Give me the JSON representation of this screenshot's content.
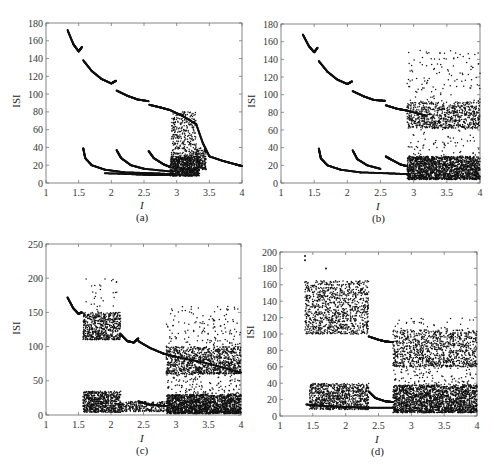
{
  "figure": {
    "panels": [
      {
        "id": "a",
        "caption": "(a)",
        "xlabel": "I",
        "ylabel": "ISI"
      },
      {
        "id": "b",
        "caption": "(b)",
        "xlabel": "I",
        "ylabel": "ISI"
      },
      {
        "id": "c",
        "caption": "(c)",
        "xlabel": "I",
        "ylabel": "ISI"
      },
      {
        "id": "d",
        "caption": "(d)",
        "xlabel": "I",
        "ylabel": "ISI"
      }
    ]
  },
  "chart_data": [
    {
      "type": "scatter",
      "panel": "(a)",
      "title": "",
      "xlabel": "I",
      "ylabel": "ISI",
      "xlim": [
        1,
        4
      ],
      "ylim": [
        0,
        180
      ],
      "xticks": [
        1,
        1.5,
        2,
        2.5,
        3,
        3.5,
        4
      ],
      "yticks": [
        0,
        20,
        40,
        60,
        80,
        100,
        120,
        140,
        160,
        180
      ],
      "box": {
        "x0": 46,
        "x1": 242,
        "y0": 23,
        "y1": 183
      },
      "branches": [
        {
          "x": [
            1.33,
            1.42,
            1.5,
            1.55
          ],
          "y": [
            172,
            156,
            148,
            153
          ]
        },
        {
          "x": [
            1.57,
            1.7,
            1.85,
            2.0,
            2.07
          ],
          "y": [
            138,
            126,
            117,
            112,
            115
          ]
        },
        {
          "x": [
            2.08,
            2.25,
            2.4,
            2.57
          ],
          "y": [
            104,
            98,
            94,
            92
          ]
        },
        {
          "x": [
            2.58,
            2.75,
            2.9,
            3.1,
            3.3
          ],
          "y": [
            88,
            85,
            82,
            75,
            66
          ]
        },
        {
          "x": [
            3.3,
            3.4,
            3.5
          ],
          "y": [
            66,
            45,
            30
          ]
        },
        {
          "x": [
            3.5,
            3.7,
            3.9,
            4.0
          ],
          "y": [
            30,
            25,
            21,
            19
          ]
        },
        {
          "x": [
            1.57,
            1.6,
            1.7,
            1.9,
            2.2,
            2.6,
            2.9
          ],
          "y": [
            39,
            28,
            20,
            15,
            12,
            11,
            10
          ]
        },
        {
          "x": [
            2.08,
            2.15,
            2.3,
            2.5,
            2.9
          ],
          "y": [
            37,
            28,
            20,
            16,
            13
          ]
        },
        {
          "x": [
            2.57,
            2.65,
            2.8,
            2.9
          ],
          "y": [
            36,
            28,
            21,
            18
          ]
        },
        {
          "x": [
            1.9,
            2.3,
            2.6,
            2.9
          ],
          "y": [
            11,
            10,
            9,
            9
          ]
        }
      ],
      "clouds": [
        {
          "x": [
            2.9,
            3.35
          ],
          "y": [
            8,
            30
          ],
          "n": 900
        },
        {
          "x": [
            2.92,
            3.3
          ],
          "y": [
            30,
            80
          ],
          "n": 320
        },
        {
          "x": [
            3.3,
            3.45
          ],
          "y": [
            15,
            40
          ],
          "n": 150
        }
      ]
    },
    {
      "type": "scatter",
      "panel": "(b)",
      "title": "",
      "xlabel": "I",
      "ylabel": "ISI",
      "xlim": [
        1,
        4
      ],
      "ylim": [
        0,
        180
      ],
      "xticks": [
        1,
        1.5,
        2,
        2.5,
        3,
        3.5,
        4
      ],
      "yticks": [
        0,
        20,
        40,
        60,
        80,
        100,
        120,
        140,
        160,
        180
      ],
      "box": {
        "x0": 281,
        "x1": 480,
        "y0": 24,
        "y1": 183
      },
      "branches": [
        {
          "x": [
            1.33,
            1.42,
            1.5,
            1.55
          ],
          "y": [
            168,
            155,
            148,
            153
          ]
        },
        {
          "x": [
            1.57,
            1.7,
            1.85,
            2.0,
            2.07
          ],
          "y": [
            138,
            126,
            117,
            112,
            115
          ]
        },
        {
          "x": [
            2.08,
            2.25,
            2.4,
            2.57
          ],
          "y": [
            104,
            98,
            94,
            93
          ]
        },
        {
          "x": [
            2.58,
            2.75,
            2.9,
            3.2
          ],
          "y": [
            88,
            84,
            82,
            76
          ]
        },
        {
          "x": [
            1.57,
            1.6,
            1.7,
            1.9,
            2.2,
            2.6,
            2.9
          ],
          "y": [
            39,
            28,
            20,
            15,
            12,
            11,
            10
          ]
        },
        {
          "x": [
            2.08,
            2.15,
            2.3,
            2.5
          ],
          "y": [
            37,
            27,
            20,
            16
          ]
        },
        {
          "x": [
            2.58,
            2.65,
            2.8,
            2.9
          ],
          "y": [
            30,
            27,
            21,
            19
          ]
        }
      ],
      "clouds": [
        {
          "x": [
            2.9,
            4.0
          ],
          "y": [
            4,
            30
          ],
          "n": 1800
        },
        {
          "x": [
            2.9,
            4.0
          ],
          "y": [
            62,
            92
          ],
          "n": 700
        },
        {
          "x": [
            2.9,
            4.0
          ],
          "y": [
            30,
            150
          ],
          "n": 260
        }
      ]
    },
    {
      "type": "scatter",
      "panel": "(c)",
      "title": "",
      "xlabel": "I",
      "ylabel": "ISI",
      "xlim": [
        1,
        4
      ],
      "ylim": [
        0,
        250
      ],
      "xticks": [
        1,
        1.5,
        2,
        2.5,
        3,
        3.5,
        4
      ],
      "yticks": [
        0,
        50,
        100,
        150,
        200,
        250
      ],
      "box": {
        "x0": 46,
        "x1": 241,
        "y0": 244,
        "y1": 415
      },
      "branches": [
        {
          "x": [
            1.33,
            1.42,
            1.5,
            1.55
          ],
          "y": [
            172,
            156,
            148,
            150
          ]
        },
        {
          "x": [
            2.15,
            2.25,
            2.35,
            2.42
          ],
          "y": [
            118,
            108,
            106,
            112
          ]
        },
        {
          "x": [
            2.42,
            2.6,
            2.8,
            3.0,
            3.5,
            4.0
          ],
          "y": [
            108,
            98,
            90,
            85,
            75,
            62
          ]
        },
        {
          "x": [
            2.42,
            2.6,
            2.85
          ],
          "y": [
            20,
            15,
            13
          ]
        }
      ],
      "clouds": [
        {
          "x": [
            1.57,
            2.15
          ],
          "y": [
            110,
            150
          ],
          "n": 600
        },
        {
          "x": [
            1.6,
            2.1
          ],
          "y": [
            150,
            205
          ],
          "n": 30
        },
        {
          "x": [
            1.57,
            2.15
          ],
          "y": [
            4,
            35
          ],
          "n": 700
        },
        {
          "x": [
            2.15,
            2.85
          ],
          "y": [
            5,
            20
          ],
          "n": 250
        },
        {
          "x": [
            2.85,
            4.0
          ],
          "y": [
            60,
            100
          ],
          "n": 900
        },
        {
          "x": [
            2.85,
            4.0
          ],
          "y": [
            2,
            30
          ],
          "n": 1800
        },
        {
          "x": [
            2.85,
            4.0
          ],
          "y": [
            30,
            160
          ],
          "n": 380
        }
      ]
    },
    {
      "type": "scatter",
      "panel": "(d)",
      "title": "",
      "xlabel": "I",
      "ylabel": "ISI",
      "xlim": [
        1,
        4
      ],
      "ylim": [
        0,
        200
      ],
      "xticks": [
        1,
        1.5,
        2,
        2.5,
        3,
        3.5,
        4
      ],
      "yticks": [
        0,
        20,
        40,
        60,
        80,
        100,
        120,
        140,
        160,
        180,
        200
      ],
      "box": {
        "x0": 280,
        "x1": 477,
        "y0": 252,
        "y1": 416
      },
      "branches": [
        {
          "x": [
            2.35,
            2.5,
            2.6,
            2.72
          ],
          "y": [
            97,
            93,
            91,
            90
          ]
        },
        {
          "x": [
            2.35,
            2.45,
            2.6,
            2.72
          ],
          "y": [
            30,
            22,
            18,
            17
          ]
        },
        {
          "x": [
            1.4,
            1.7,
            2.0,
            2.35,
            2.72
          ],
          "y": [
            14,
            12,
            11,
            10,
            10
          ]
        }
      ],
      "clouds": [
        {
          "x": [
            1.38,
            2.35
          ],
          "y": [
            100,
            165
          ],
          "n": 1000
        },
        {
          "x": [
            1.45,
            2.35
          ],
          "y": [
            8,
            40
          ],
          "n": 900
        },
        {
          "x": [
            2.72,
            4.0
          ],
          "y": [
            60,
            105
          ],
          "n": 900
        },
        {
          "x": [
            2.72,
            4.0
          ],
          "y": [
            4,
            38
          ],
          "n": 2000
        },
        {
          "x": [
            2.72,
            4.0
          ],
          "y": [
            38,
            120
          ],
          "n": 260
        }
      ],
      "outliers": [
        {
          "x": 1.38,
          "y": 190
        },
        {
          "x": 1.38,
          "y": 195
        },
        {
          "x": 1.7,
          "y": 180
        }
      ]
    }
  ]
}
